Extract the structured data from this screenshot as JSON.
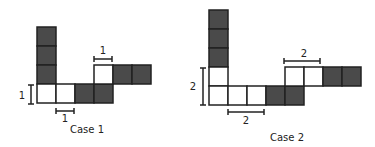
{
  "colors": {
    "shaded": "#4a4a4a",
    "empty": "#ffffff",
    "stroke": "#222222"
  },
  "case1": {
    "caption": "Case 1",
    "height_label": "1",
    "bottom_width_label": "1",
    "top_width_label": "1"
  },
  "case2": {
    "caption": "Case 2",
    "height_label": "2",
    "bottom_width_label": "2",
    "top_width_label": "2"
  }
}
